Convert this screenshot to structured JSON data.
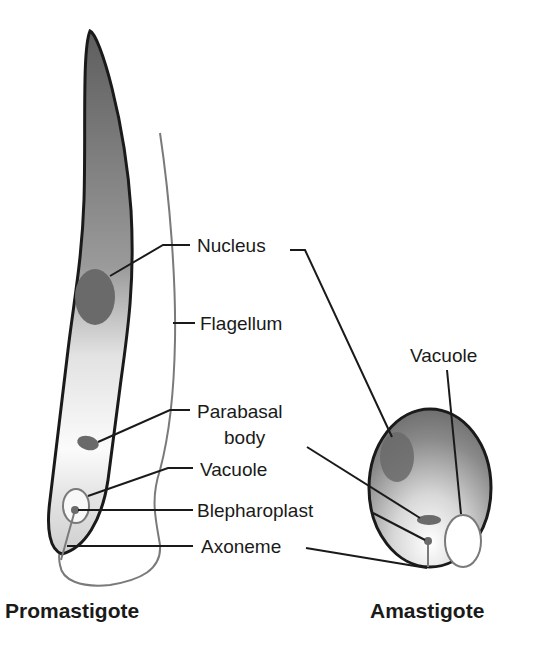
{
  "promastigote": {
    "title": "Promastigote",
    "labels": {
      "nucleus": "Nucleus",
      "flagellum": "Flagellum",
      "parabasal_line1": "Parabasal",
      "parabasal_line2": "body",
      "vacuole": "Vacuole",
      "blepharoplast": "Blepharoplast",
      "axoneme": "Axoneme"
    }
  },
  "amastigote": {
    "title": "Amastigote",
    "labels": {
      "vacuole": "Vacuole"
    }
  },
  "colors": {
    "outline": "#1a1a1a",
    "body_dark": "#6e6e6e",
    "body_light": "#f4f4f4",
    "organelle": "#6a6a6a",
    "flagellum": "#7a7a7a"
  }
}
